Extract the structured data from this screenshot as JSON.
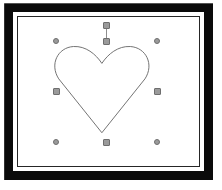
{
  "window": {
    "title": "Shape Editor",
    "background_color": "#ffffff"
  },
  "frame": {
    "name": "picture-frame",
    "outer_band_color": "#0a0a0a",
    "mat_color": "#ffffff",
    "keyline_color": "#262626",
    "outer_band_width": "9",
    "mat_width": "4",
    "keyline_width": "1"
  },
  "canvas": {
    "name": "drawing-canvas",
    "background_color": "#ffffff",
    "width": 191,
    "height": 159
  },
  "shape": {
    "name": "heart-shape",
    "type": "path",
    "stroke_color": "#6b6b6b",
    "fill": "none",
    "stroke_width": "1",
    "selected": "true",
    "bounds": {
      "left": 38,
      "top": 24,
      "width": 101,
      "height": 101
    },
    "path": "M 88.5 123.5 L 43.0 66.0 C 33.0 50.5 42.0 32.5 58.5 31.5 C 71.5 30.8 82.0 39.5 88.5 49.5 C 95.0 39.5 105.5 30.8 118.5 31.5 C 135.0 32.5 144.0 50.5 134.0 66.0 Z"
  },
  "selection": {
    "name": "selection-handles",
    "handle_fill_color": "#9a9a9a",
    "handle_border_color": "#6e6e6e",
    "corner_shape": "circle",
    "edge_shape": "square",
    "handles": [
      {
        "name": "handle-top-left",
        "role": "corner",
        "x": 38,
        "y": 24
      },
      {
        "name": "handle-top-center",
        "role": "edge",
        "x": 88,
        "y": 24
      },
      {
        "name": "handle-top-right",
        "role": "corner",
        "x": 139,
        "y": 24
      },
      {
        "name": "handle-middle-left",
        "role": "edge",
        "x": 38,
        "y": 74
      },
      {
        "name": "handle-middle-right",
        "role": "edge",
        "x": 139,
        "y": 74
      },
      {
        "name": "handle-bottom-left",
        "role": "corner",
        "x": 38,
        "y": 125
      },
      {
        "name": "handle-bottom-center",
        "role": "edge",
        "x": 88,
        "y": 125
      },
      {
        "name": "handle-bottom-right",
        "role": "corner",
        "x": 139,
        "y": 125
      }
    ],
    "rotation_handle": {
      "name": "rotation-handle",
      "x": 88,
      "y": 8,
      "stem_color": "#8d8d8d",
      "stem_length": 16
    }
  }
}
